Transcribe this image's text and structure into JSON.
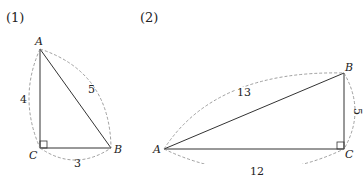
{
  "figures": [
    {
      "number": "(1)",
      "vertices": {
        "A": "A",
        "B": "B",
        "C": "C"
      },
      "sides": {
        "AC": "4",
        "AB": "5",
        "CB": "3"
      },
      "right_angle_at": "C"
    },
    {
      "number": "(2)",
      "vertices": {
        "A": "A",
        "B": "B",
        "C": "C"
      },
      "sides": {
        "AB": "13",
        "BC": "5",
        "AC": "12"
      },
      "right_angle_at": "C"
    }
  ],
  "colors": {
    "line": "#333333",
    "dashed": "#888888",
    "text": "#222222"
  }
}
